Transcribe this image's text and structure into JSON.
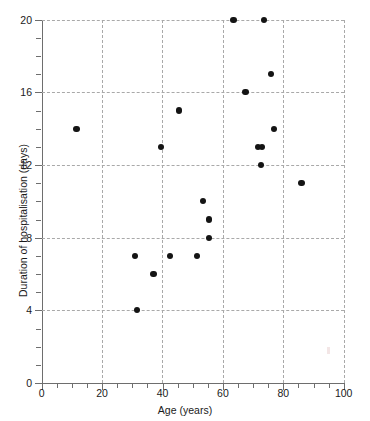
{
  "chart_data": {
    "type": "scatter",
    "title": "",
    "xlabel": "Age (years)",
    "ylabel": "Duration of hospitalisation (days)",
    "xlim": [
      0,
      100
    ],
    "ylim": [
      0,
      20
    ],
    "xticks": [
      0,
      20,
      40,
      60,
      80,
      100
    ],
    "yticks": [
      0,
      4,
      8,
      12,
      16,
      20
    ],
    "xtick_labels": [
      "0",
      "20",
      "40",
      "60",
      "80",
      "100"
    ],
    "ytick_labels": [
      "0",
      "4",
      "8",
      "12",
      "16",
      "20"
    ],
    "x_minor_tick_step": 5,
    "y_minor_tick_step": 1,
    "grid": true,
    "grid_style": "dashed",
    "grid_color": "#a9a9a9",
    "legend": null,
    "marker": "filled-circle",
    "marker_color": "#141414",
    "points": [
      {
        "x": 11.5,
        "y": 14
      },
      {
        "x": 31.0,
        "y": 7
      },
      {
        "x": 31.5,
        "y": 4
      },
      {
        "x": 37.0,
        "y": 6
      },
      {
        "x": 39.5,
        "y": 13
      },
      {
        "x": 42.5,
        "y": 7
      },
      {
        "x": 45.5,
        "y": 15
      },
      {
        "x": 51.5,
        "y": 7
      },
      {
        "x": 53.5,
        "y": 10
      },
      {
        "x": 55.5,
        "y": 9
      },
      {
        "x": 55.5,
        "y": 8
      },
      {
        "x": 63.5,
        "y": 20
      },
      {
        "x": 67.5,
        "y": 16
      },
      {
        "x": 71.5,
        "y": 13
      },
      {
        "x": 73.0,
        "y": 13
      },
      {
        "x": 72.5,
        "y": 12
      },
      {
        "x": 73.5,
        "y": 20
      },
      {
        "x": 76.0,
        "y": 17
      },
      {
        "x": 77.0,
        "y": 14
      },
      {
        "x": 86.0,
        "y": 11
      }
    ]
  }
}
